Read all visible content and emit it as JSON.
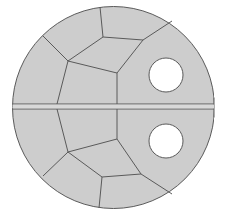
{
  "diagram": {
    "type": "mesh-cross-section",
    "colors": {
      "background": "#ffffff",
      "fill": "#cdcdcd",
      "edge": "#5a5a5a",
      "hole": "#ffffff"
    },
    "disk": {
      "cx": 113.5,
      "cy": 107.5,
      "r": 101,
      "right_cut_x": 214
    },
    "split_band": {
      "y_top": 104,
      "y_bottom": 109
    },
    "holes": [
      {
        "name": "upper-hole",
        "cx": 166,
        "cy": 75,
        "r": 17
      },
      {
        "name": "lower-hole",
        "cx": 166,
        "cy": 141,
        "r": 17
      }
    ],
    "mesh_edges": [
      [
        [
          100,
          7
        ],
        [
          103,
          37
        ]
      ],
      [
        [
          103,
          37
        ],
        [
          143,
          40
        ]
      ],
      [
        [
          143,
          40
        ],
        [
          172,
          21
        ]
      ],
      [
        [
          43,
          36
        ],
        [
          68,
          61
        ]
      ],
      [
        [
          68,
          61
        ],
        [
          103,
          37
        ]
      ],
      [
        [
          68,
          61
        ],
        [
          117,
          73
        ]
      ],
      [
        [
          143,
          40
        ],
        [
          117,
          73
        ]
      ],
      [
        [
          68,
          61
        ],
        [
          57,
          104
        ]
      ],
      [
        [
          117,
          73
        ],
        [
          117,
          104
        ]
      ],
      [
        [
          57,
          109
        ],
        [
          68,
          152
        ]
      ],
      [
        [
          117,
          109
        ],
        [
          117,
          139
        ]
      ],
      [
        [
          68,
          152
        ],
        [
          117,
          139
        ]
      ],
      [
        [
          117,
          139
        ],
        [
          141,
          174
        ]
      ],
      [
        [
          68,
          152
        ],
        [
          43,
          176
        ]
      ],
      [
        [
          68,
          152
        ],
        [
          102,
          177
        ]
      ],
      [
        [
          102,
          177
        ],
        [
          141,
          174
        ]
      ],
      [
        [
          102,
          177
        ],
        [
          99,
          208
        ]
      ],
      [
        [
          141,
          174
        ],
        [
          172,
          194
        ]
      ]
    ]
  }
}
